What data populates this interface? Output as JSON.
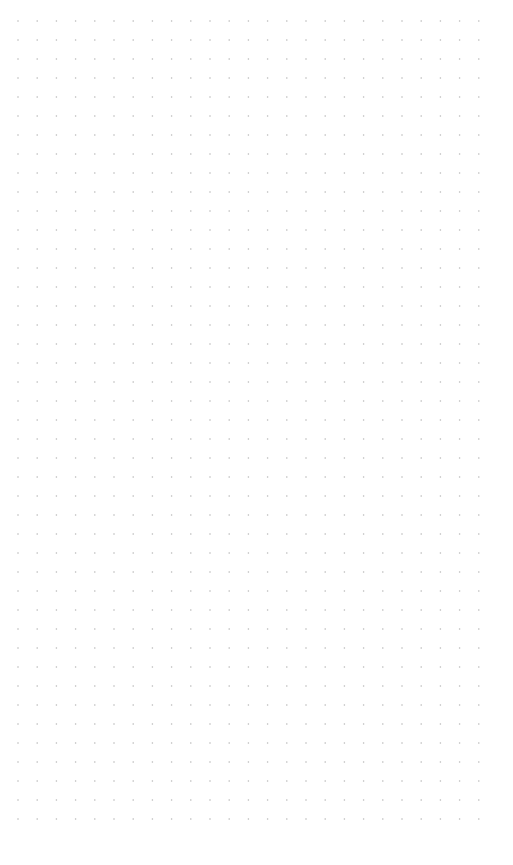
{
  "canvas": {
    "background": "#ffffff",
    "grid": {
      "type": "dots",
      "dot_color": "#b8b8b8",
      "dot_radius": 0.8,
      "origin_x": 18,
      "origin_y": 21,
      "spacing_x": 19.2,
      "spacing_y": 19,
      "columns": 25,
      "rows": 43
    }
  }
}
